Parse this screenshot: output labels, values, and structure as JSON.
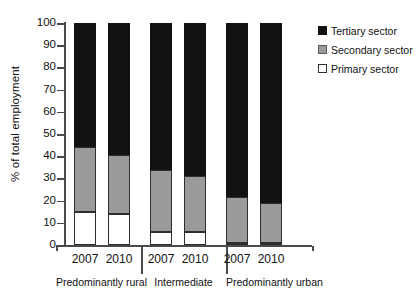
{
  "chart_data": {
    "type": "bar",
    "subtype": "stacked-100-percent",
    "title": "",
    "xlabel": "",
    "ylabel": "% of total employment",
    "ylim": [
      0,
      100
    ],
    "ytick_labels": [
      "100",
      "90",
      "80",
      "70",
      "60",
      "50",
      "40",
      "30",
      "20",
      "10",
      "0"
    ],
    "ytick_values": [
      100,
      90,
      80,
      70,
      60,
      50,
      40,
      30,
      20,
      10,
      0
    ],
    "grid": false,
    "legend_position": "top-right",
    "categories": [
      "2007",
      "2010",
      "2007",
      "2010",
      "2007",
      "2010"
    ],
    "groups": [
      {
        "label": "Predominantly rural",
        "years": [
          "2007",
          "2010"
        ]
      },
      {
        "label": "Intermediate",
        "years": [
          "2007",
          "2010"
        ]
      },
      {
        "label": "Predominantly urban",
        "years": [
          "2007",
          "2010"
        ]
      }
    ],
    "series": [
      {
        "name": "Primary sector",
        "color": "#ffffff",
        "values": [
          15,
          14,
          6,
          6,
          0.7,
          0.7
        ]
      },
      {
        "name": "Secondary sector",
        "color": "#9a9a9a",
        "values": [
          29,
          26.5,
          28,
          25,
          20.8,
          18.3
        ]
      },
      {
        "name": "Tertiary sector",
        "color": "#121212",
        "values": [
          56,
          59.5,
          66,
          69,
          78.5,
          81
        ]
      }
    ],
    "bars": [
      {
        "group": "Predominantly rural",
        "year": "2007",
        "primary": 15,
        "secondary": 29,
        "tertiary": 56
      },
      {
        "group": "Predominantly rural",
        "year": "2010",
        "primary": 14,
        "secondary": 26.5,
        "tertiary": 59.5
      },
      {
        "group": "Intermediate",
        "year": "2007",
        "primary": 6,
        "secondary": 28,
        "tertiary": 66
      },
      {
        "group": "Intermediate",
        "year": "2010",
        "primary": 6,
        "secondary": 25,
        "tertiary": 69
      },
      {
        "group": "Predominantly urban",
        "year": "2007",
        "primary": 0.7,
        "secondary": 20.8,
        "tertiary": 78.5
      },
      {
        "group": "Predominantly urban",
        "year": "2010",
        "primary": 0.7,
        "secondary": 18.3,
        "tertiary": 81
      }
    ]
  },
  "legend": {
    "items": [
      {
        "label": "Tertiary sector",
        "swatch": "tertiary"
      },
      {
        "label": "Secondary sector",
        "swatch": "secondary"
      },
      {
        "label": "Primary sector",
        "swatch": "primary"
      }
    ]
  }
}
